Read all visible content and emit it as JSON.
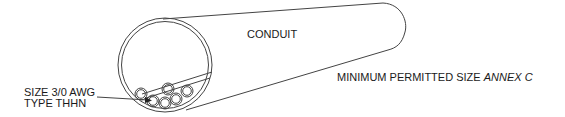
{
  "diagram": {
    "labels": {
      "conduit": "CONDUIT",
      "conductor_size": "SIZE 3/0 AWG",
      "conductor_type": "TYPE THHN",
      "min_size_prefix": "MINIMUM PERMITTED SIZE ",
      "min_size_ref": "ANNEX C"
    },
    "conductor_count": 7,
    "colors": {
      "stroke": "#444444",
      "text": "#1a1a1a",
      "background": "#ffffff"
    }
  }
}
